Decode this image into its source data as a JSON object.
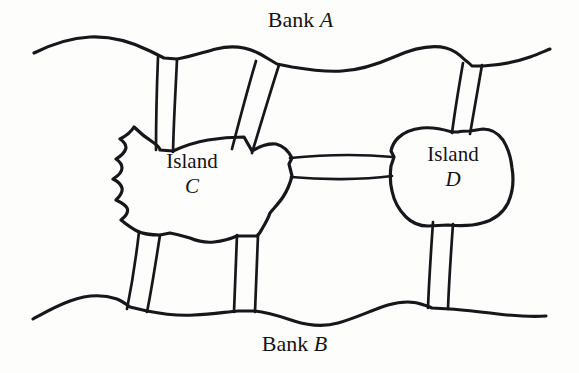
{
  "figure": {
    "name": "koenigsberg-bridges-diagram",
    "background_color": "#fdfdfc",
    "ink_color": "#17161a"
  },
  "labels": {
    "bank_a": {
      "word": "Bank",
      "letter": "A"
    },
    "bank_b": {
      "word": "Bank",
      "letter": "B"
    },
    "island_c": {
      "word": "Island",
      "letter": "C"
    },
    "island_d": {
      "word": "Island",
      "letter": "D"
    }
  },
  "landmasses": [
    {
      "id": "bank-a",
      "label": "Bank A",
      "kind": "bank",
      "position": "top"
    },
    {
      "id": "bank-b",
      "label": "Bank B",
      "kind": "bank",
      "position": "bottom"
    },
    {
      "id": "island-c",
      "label": "Island C",
      "kind": "island",
      "position": "center-left"
    },
    {
      "id": "island-d",
      "label": "Island D",
      "kind": "island",
      "position": "center-right"
    }
  ],
  "bridges": [
    {
      "id": "bridge-a-c-left",
      "from": "Bank A",
      "to": "Island C",
      "orientation": "vertical"
    },
    {
      "id": "bridge-a-c-right",
      "from": "Bank A",
      "to": "Island C",
      "orientation": "diagonal"
    },
    {
      "id": "bridge-a-d",
      "from": "Bank A",
      "to": "Island D",
      "orientation": "vertical"
    },
    {
      "id": "bridge-c-d",
      "from": "Island C",
      "to": "Island D",
      "orientation": "horizontal"
    },
    {
      "id": "bridge-c-b-left",
      "from": "Island C",
      "to": "Bank B",
      "orientation": "diagonal"
    },
    {
      "id": "bridge-c-b-right",
      "from": "Island C",
      "to": "Bank B",
      "orientation": "vertical"
    },
    {
      "id": "bridge-d-b",
      "from": "Island D",
      "to": "Bank B",
      "orientation": "vertical"
    }
  ],
  "counts": {
    "landmasses": 4,
    "bridges": 7
  }
}
